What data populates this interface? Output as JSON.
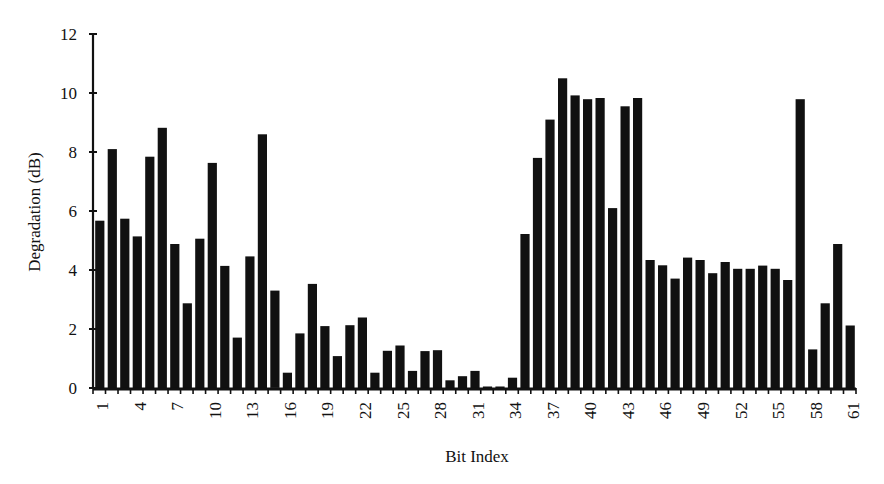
{
  "chart_data": {
    "type": "bar",
    "title": "",
    "xlabel": "Bit Index",
    "ylabel": "Degradation (dB)",
    "ylim": [
      0,
      12
    ],
    "yticks": [
      0,
      2,
      4,
      6,
      8,
      10,
      12
    ],
    "xtick_labels": [
      "1",
      "4",
      "7",
      "10",
      "13",
      "16",
      "19",
      "22",
      "25",
      "28",
      "31",
      "34",
      "37",
      "40",
      "43",
      "46",
      "49",
      "52",
      "55",
      "58",
      "61"
    ],
    "grid": false,
    "legend": null,
    "bar_color": "#111111",
    "categories": [
      1,
      2,
      3,
      4,
      5,
      6,
      7,
      8,
      9,
      10,
      11,
      12,
      13,
      14,
      15,
      16,
      17,
      18,
      19,
      20,
      21,
      22,
      23,
      24,
      25,
      26,
      27,
      28,
      29,
      30,
      31,
      32,
      33,
      34,
      35,
      36,
      37,
      38,
      39,
      40,
      41,
      42,
      43,
      44,
      45,
      46,
      47,
      48,
      49,
      50,
      51,
      52,
      53,
      54,
      55,
      56,
      57,
      58,
      59,
      60,
      61
    ],
    "values": [
      5.67,
      8.1,
      5.74,
      5.14,
      7.84,
      8.82,
      4.88,
      2.87,
      5.06,
      7.63,
      4.14,
      1.71,
      4.46,
      8.6,
      3.3,
      0.52,
      1.85,
      3.53,
      2.1,
      1.08,
      2.13,
      2.39,
      0.52,
      1.26,
      1.44,
      0.58,
      1.25,
      1.28,
      0.26,
      0.4,
      0.58,
      0.05,
      0.05,
      0.35,
      5.22,
      7.8,
      9.1,
      10.5,
      9.92,
      9.79,
      9.83,
      6.1,
      9.55,
      9.83,
      4.34,
      4.16,
      3.71,
      4.42,
      4.34,
      3.89,
      4.27,
      4.04,
      4.04,
      4.15,
      4.04,
      3.66,
      9.79,
      1.31,
      2.87,
      4.88,
      2.12
    ]
  }
}
